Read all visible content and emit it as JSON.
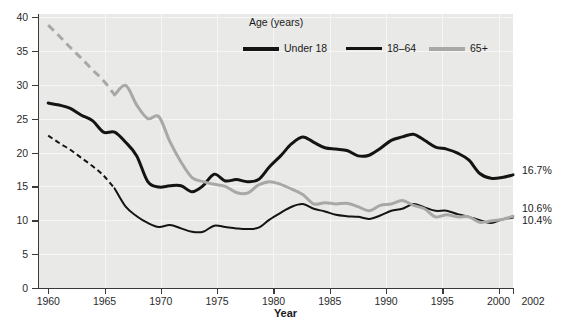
{
  "chart_data": {
    "type": "line",
    "title": "",
    "xlabel": "Year",
    "ylabel": "",
    "xlim": [
      1960,
      2002
    ],
    "ylim": [
      0,
      40
    ],
    "grid": true,
    "legend_position": "top-center",
    "legend_title": "Age (years)",
    "x_ticks": [
      "1960",
      "1965",
      "1970",
      "1975",
      "1980",
      "1985",
      "1990",
      "1995",
      "2000",
      "2002"
    ],
    "x_tick_values": [
      1960,
      1965,
      1970,
      1975,
      1980,
      1985,
      1990,
      1995,
      2000,
      2002
    ],
    "y_ticks": [
      "0",
      "5",
      "10",
      "15",
      "20",
      "25",
      "30",
      "35",
      "40"
    ],
    "y_tick_values": [
      0,
      5,
      10,
      15,
      20,
      25,
      30,
      35,
      40
    ],
    "series": [
      {
        "name": "Under 18",
        "color": "#141414",
        "style": "solid",
        "linewidth": 3.0,
        "end_label": "16.7%",
        "x": [
          1960,
          1961,
          1962,
          1963,
          1964,
          1965,
          1966,
          1967,
          1968,
          1969,
          1970,
          1971,
          1972,
          1973,
          1974,
          1975,
          1976,
          1977,
          1978,
          1979,
          1980,
          1981,
          1982,
          1983,
          1984,
          1985,
          1986,
          1987,
          1988,
          1989,
          1990,
          1991,
          1992,
          1993,
          1994,
          1995,
          1996,
          1997,
          1998,
          1999,
          2000,
          2001,
          2002
        ],
        "y": [
          27.3,
          27.0,
          26.5,
          25.5,
          24.7,
          23.0,
          23.0,
          21.5,
          19.5,
          15.7,
          14.9,
          15.1,
          15.1,
          14.2,
          15.1,
          16.8,
          15.8,
          16.0,
          15.7,
          16.0,
          17.9,
          19.5,
          21.3,
          22.3,
          21.5,
          20.7,
          20.5,
          20.3,
          19.5,
          19.6,
          20.6,
          21.8,
          22.3,
          22.7,
          21.8,
          20.8,
          20.5,
          19.9,
          18.9,
          16.9,
          16.2,
          16.3,
          16.7
        ],
        "dashed_segment": null
      },
      {
        "name": "18-64",
        "color": "#141414",
        "style": "solid-with-dashed-start",
        "linewidth": 2.0,
        "end_label": "10.4%",
        "x": [
          1960,
          1961,
          1962,
          1963,
          1964,
          1965,
          1966,
          1967,
          1968,
          1969,
          1970,
          1971,
          1972,
          1973,
          1974,
          1975,
          1976,
          1977,
          1978,
          1979,
          1980,
          1981,
          1982,
          1983,
          1984,
          1985,
          1986,
          1987,
          1988,
          1989,
          1990,
          1991,
          1992,
          1993,
          1994,
          1995,
          1996,
          1997,
          1998,
          1999,
          2000,
          2001,
          2002
        ],
        "y": [
          22.5,
          21.4,
          20.4,
          19.2,
          18.0,
          16.6,
          14.7,
          12.0,
          10.6,
          9.6,
          9.0,
          9.3,
          8.8,
          8.3,
          8.3,
          9.2,
          9.0,
          8.8,
          8.7,
          8.9,
          10.1,
          11.1,
          12.0,
          12.4,
          11.7,
          11.3,
          10.8,
          10.6,
          10.5,
          10.2,
          10.7,
          11.4,
          11.7,
          12.4,
          11.9,
          11.4,
          11.4,
          10.9,
          10.5,
          10.0,
          9.6,
          10.1,
          10.4
        ],
        "dashed_range": [
          1960,
          1966
        ]
      },
      {
        "name": "65+",
        "color": "#a8a8a8",
        "style": "solid-with-dashed-start",
        "linewidth": 3.0,
        "end_label": "10.6%",
        "x": [
          1960,
          1961,
          1962,
          1963,
          1964,
          1965,
          1966,
          1967,
          1968,
          1969,
          1970,
          1971,
          1972,
          1973,
          1974,
          1975,
          1976,
          1977,
          1978,
          1979,
          1980,
          1981,
          1982,
          1983,
          1984,
          1985,
          1986,
          1987,
          1988,
          1989,
          1990,
          1991,
          1992,
          1993,
          1994,
          1995,
          1996,
          1997,
          1998,
          1999,
          2000,
          2001,
          2002
        ],
        "y": [
          38.8,
          37.2,
          35.5,
          33.9,
          32.2,
          30.6,
          28.5,
          29.9,
          27.0,
          25.0,
          25.3,
          21.6,
          18.6,
          16.3,
          15.7,
          15.3,
          15.0,
          14.1,
          14.0,
          15.2,
          15.7,
          15.3,
          14.6,
          13.8,
          12.4,
          12.6,
          12.4,
          12.5,
          12.0,
          11.4,
          12.2,
          12.4,
          12.9,
          12.2,
          11.7,
          10.5,
          10.8,
          10.5,
          10.5,
          9.7,
          9.9,
          10.1,
          10.6
        ],
        "dashed_range": [
          1960,
          1966
        ]
      }
    ]
  },
  "axes": {
    "x_title": "Year",
    "y_title": ""
  },
  "legend": {
    "title": "Age (years)",
    "entries": [
      {
        "label": "Under 18",
        "color": "#141414",
        "weight": "thick"
      },
      {
        "label": "18–64",
        "color": "#141414",
        "weight": "medium"
      },
      {
        "label": "65+",
        "color": "#a8a8a8",
        "weight": "thick"
      }
    ]
  },
  "end_labels": [
    {
      "text": "16.7%",
      "series": "Under 18"
    },
    {
      "text": "10.6%",
      "series": "65+"
    },
    {
      "text": "10.4%",
      "series": "18-64"
    }
  ],
  "artifact_text": {
    "line1": "Youth in Crisis",
    "line2": "about poverty and",
    "line3": "children"
  },
  "colors": {
    "plot_background": "#e9e9e7",
    "page_background": "#ffffff",
    "axis": "#3a3a3a",
    "gridline": "#f7f7f5",
    "series_dark": "#141414",
    "series_gray": "#a8a8a8",
    "text": "#1a1a1a"
  }
}
